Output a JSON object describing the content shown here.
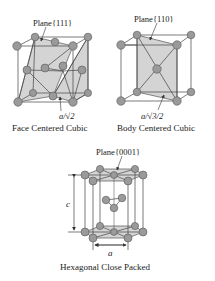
{
  "fcc": {
    "plane_label": "Plane{111}",
    "dimension_label": "a/√2",
    "caption": "Face Centered Cubic"
  },
  "bcc": {
    "plane_label": "Plane{110}",
    "dimension_label": "a/√3/2",
    "caption": "Body Centered Cubic"
  },
  "hcp": {
    "plane_label": "Plane{0001}",
    "height_label": "c",
    "width_label": "a",
    "caption": "Hexagonal Close Packed"
  },
  "colors": {
    "atom_fill": "#9a9a9a",
    "atom_stroke": "#555555",
    "plane_fill": "#d4d4d4",
    "line": "#444444",
    "text": "#222222"
  }
}
